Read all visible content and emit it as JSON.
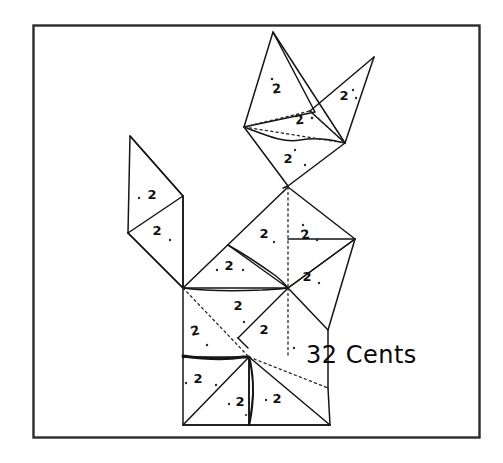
{
  "page": {
    "background_color": "#ffffff",
    "ink_color": "#111111",
    "border": {
      "color": "#2b2b2b",
      "x": 33,
      "y": 25,
      "width": 447,
      "height": 413
    }
  },
  "figure": {
    "name": "tangram-cat-figure",
    "piece_value_label": "2",
    "pieces": [
      {
        "id": "head-left-triangle",
        "label": "2",
        "label_x": 277,
        "label_y": 93
      },
      {
        "id": "ear-right-triangle",
        "label": "2",
        "label_x": 344,
        "label_y": 100
      },
      {
        "id": "head-center-triangle",
        "label": "2",
        "label_x": 300,
        "label_y": 124
      },
      {
        "id": "head-lower-triangle",
        "label": "2",
        "label_x": 288,
        "label_y": 163
      },
      {
        "id": "tail-upper-triangle",
        "label": "2",
        "label_x": 152,
        "label_y": 199
      },
      {
        "id": "tail-lower-triangle",
        "label": "2",
        "label_x": 157,
        "label_y": 235
      },
      {
        "id": "back-triangle",
        "label": "2",
        "label_x": 264,
        "label_y": 238
      },
      {
        "id": "shoulder-triangle",
        "label": "2",
        "label_x": 306,
        "label_y": 239
      },
      {
        "id": "chest-triangle",
        "label": "2",
        "label_x": 229,
        "label_y": 270
      },
      {
        "id": "front-leg-triangle",
        "label": "2",
        "label_x": 307,
        "label_y": 281
      },
      {
        "id": "body-center-triangle",
        "label": "2",
        "label_x": 238,
        "label_y": 310
      },
      {
        "id": "body-left-triangle",
        "label": "2",
        "label_x": 196,
        "label_y": 335
      },
      {
        "id": "haunch-triangle",
        "label": "2",
        "label_x": 264,
        "label_y": 334
      },
      {
        "id": "hind-square",
        "label": "2",
        "label_x": 198,
        "label_y": 383
      },
      {
        "id": "foot-left-triangle",
        "label": "2",
        "label_x": 240,
        "label_y": 406
      },
      {
        "id": "foot-right-triangle",
        "label": "2",
        "label_x": 277,
        "label_y": 403
      }
    ]
  },
  "caption": {
    "value_text": "32 Cents",
    "x": 306,
    "y": 363
  },
  "footer": {
    "text": ""
  }
}
